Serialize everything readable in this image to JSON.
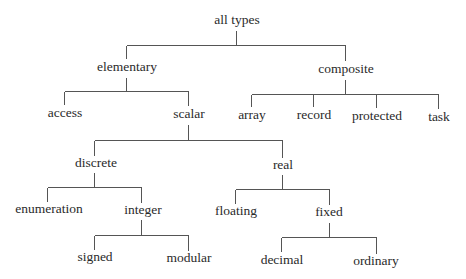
{
  "diagram": {
    "type": "tree",
    "colors": {
      "text": "#2a2a2a",
      "line": "#555555",
      "background": "#ffffff"
    },
    "nodes": [
      {
        "id": "all_types",
        "label": "all types",
        "x": 237,
        "y": 24
      },
      {
        "id": "elementary",
        "label": "elementary",
        "x": 127,
        "y": 71
      },
      {
        "id": "composite",
        "label": "composite",
        "x": 346,
        "y": 73
      },
      {
        "id": "access",
        "label": "access",
        "x": 65,
        "y": 117
      },
      {
        "id": "scalar",
        "label": "scalar",
        "x": 189,
        "y": 118
      },
      {
        "id": "array",
        "label": "array",
        "x": 252,
        "y": 119
      },
      {
        "id": "record",
        "label": "record",
        "x": 314,
        "y": 119
      },
      {
        "id": "protected",
        "label": "protected",
        "x": 377,
        "y": 120
      },
      {
        "id": "task",
        "label": "task",
        "x": 439,
        "y": 121
      },
      {
        "id": "discrete",
        "label": "discrete",
        "x": 96,
        "y": 167
      },
      {
        "id": "real",
        "label": "real",
        "x": 283,
        "y": 169
      },
      {
        "id": "enumeration",
        "label": "enumeration",
        "x": 49,
        "y": 213
      },
      {
        "id": "integer",
        "label": "integer",
        "x": 143,
        "y": 214
      },
      {
        "id": "floating",
        "label": "floating",
        "x": 236,
        "y": 215
      },
      {
        "id": "fixed",
        "label": "fixed",
        "x": 329,
        "y": 216
      },
      {
        "id": "signed",
        "label": "signed",
        "x": 95,
        "y": 261
      },
      {
        "id": "modular",
        "label": "modular",
        "x": 189,
        "y": 262
      },
      {
        "id": "decimal",
        "label": "decimal",
        "x": 282,
        "y": 264
      },
      {
        "id": "ordinary",
        "label": "ordinary",
        "x": 376,
        "y": 265
      }
    ],
    "edges": [
      {
        "from": "all_types",
        "to": [
          "elementary",
          "composite"
        ],
        "px": 236,
        "py0": 30,
        "by": 45,
        "xs": [
          126,
          345
        ],
        "cy1": [
          58,
          60
        ]
      },
      {
        "from": "elementary",
        "to": [
          "access",
          "scalar"
        ],
        "px": 126,
        "py0": 77,
        "by": 91,
        "xs": [
          64,
          188
        ],
        "cy1": [
          104,
          105
        ]
      },
      {
        "from": "composite",
        "to": [
          "array",
          "record",
          "protected",
          "task"
        ],
        "px": 345,
        "py0": 79,
        "by": 94,
        "xs": [
          251,
          313,
          376,
          438
        ],
        "cy1": [
          106,
          106,
          107,
          108
        ]
      },
      {
        "from": "scalar",
        "to": [
          "discrete",
          "real"
        ],
        "px": 188,
        "py0": 124,
        "by": 140,
        "xs": [
          94,
          282
        ],
        "cy1": [
          155,
          157
        ]
      },
      {
        "from": "discrete",
        "to": [
          "enumeration",
          "integer"
        ],
        "px": 94,
        "py0": 172,
        "by": 187,
        "xs": [
          47,
          141
        ],
        "cy1": [
          201,
          202
        ]
      },
      {
        "from": "real",
        "to": [
          "floating",
          "fixed"
        ],
        "px": 282,
        "py0": 174,
        "by": 189,
        "xs": [
          235,
          329
        ],
        "cy1": [
          203,
          204
        ]
      },
      {
        "from": "integer",
        "to": [
          "signed",
          "modular"
        ],
        "px": 141,
        "py0": 219,
        "by": 235,
        "xs": [
          94,
          188
        ],
        "cy1": [
          249,
          250
        ]
      },
      {
        "from": "fixed",
        "to": [
          "decimal",
          "ordinary"
        ],
        "px": 329,
        "py0": 222,
        "by": 237,
        "xs": [
          281,
          376
        ],
        "cy1": [
          251,
          253
        ]
      }
    ]
  }
}
